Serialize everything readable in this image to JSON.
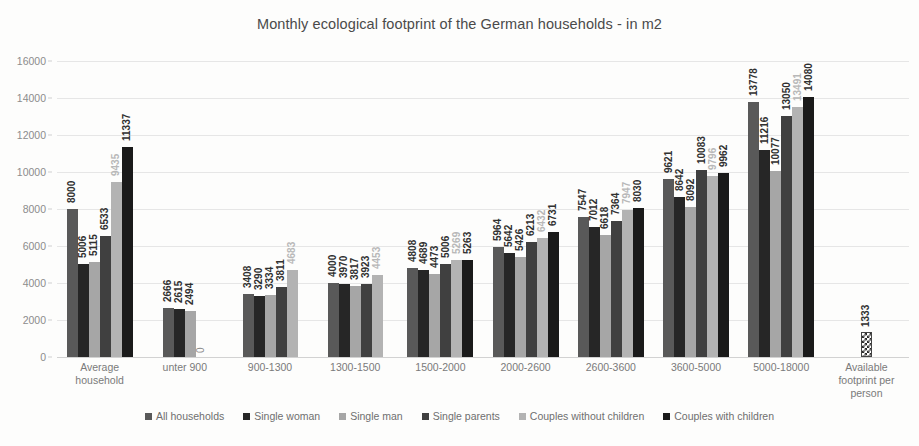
{
  "chart_data": {
    "type": "bar",
    "title": "Monthly ecological footprint of the German households - in m2",
    "xlabel": "",
    "ylabel": "",
    "ylim": [
      0,
      16000
    ],
    "yticks": [
      0,
      2000,
      4000,
      6000,
      8000,
      10000,
      12000,
      14000,
      16000
    ],
    "grid": true,
    "legend_position": "bottom",
    "categories": [
      "Average household",
      "unter 900",
      "900-1300",
      "1300-1500",
      "1500-2000",
      "2000-2600",
      "2600-3600",
      "3600-5000",
      "5000-18000",
      "Available footprint per person"
    ],
    "series": [
      {
        "name": "All households",
        "color": "#595959",
        "values": [
          8000,
          2666,
          3408,
          4000,
          4808,
          5964,
          7547,
          9621,
          13778,
          null
        ]
      },
      {
        "name": "Single woman",
        "color": "#262626",
        "values": [
          5006,
          2615,
          3290,
          3970,
          4689,
          5642,
          7012,
          8642,
          11216,
          null
        ]
      },
      {
        "name": "Single man",
        "color": "#a6a6a6",
        "values": [
          5115,
          2494,
          3334,
          3817,
          4473,
          5426,
          6618,
          8092,
          10077,
          null
        ]
      },
      {
        "name": "Single parents",
        "color": "#404040",
        "values": [
          6533,
          0,
          3811,
          3923,
          5006,
          6213,
          7364,
          10083,
          13050,
          null
        ]
      },
      {
        "name": "Couples without children",
        "color": "#b3b3b3",
        "values": [
          9435,
          null,
          4683,
          4453,
          5269,
          6432,
          7947,
          9796,
          13491,
          null
        ]
      },
      {
        "name": "Couples with children",
        "color": "#1a1a1a",
        "values": [
          11337,
          null,
          null,
          null,
          5263,
          6731,
          8030,
          9962,
          14080,
          null
        ]
      }
    ],
    "extra_bar": {
      "name": "Available footprint per person",
      "value": 1333,
      "pattern": "checkered"
    },
    "light_labels": [
      {
        "group": 0,
        "series": 4
      },
      {
        "group": 2,
        "series": 4
      },
      {
        "group": 3,
        "series": 4
      },
      {
        "group": 4,
        "series": 4
      },
      {
        "group": 5,
        "series": 4
      },
      {
        "group": 6,
        "series": 4
      },
      {
        "group": 7,
        "series": 4
      },
      {
        "group": 8,
        "series": 4
      }
    ]
  }
}
